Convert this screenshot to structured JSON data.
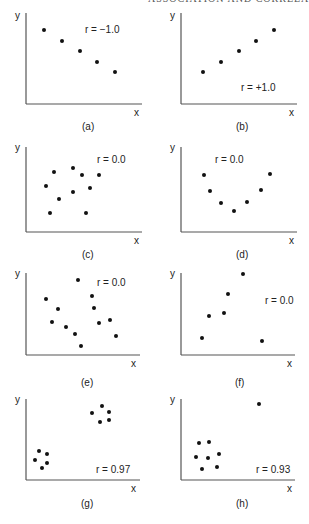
{
  "page": {
    "running_header": "ASSOCIATION AND CORRELATION",
    "caption": ""
  },
  "style": {
    "axis_color": "#555555",
    "point_color": "#111111",
    "text_color": "#222222"
  },
  "chart_data": [
    {
      "type": "scatter",
      "id": "a",
      "panel_label": "(a)",
      "annotation": "r = −1.0",
      "xlabel": "x",
      "ylabel": "y",
      "axis": {
        "x0": 26,
        "y0": 104,
        "x1": 142,
        "ytop": 13
      },
      "label_pos": {
        "annot": [
          85,
          33
        ],
        "panel": [
          82,
          130
        ],
        "xl": [
          134,
          116
        ],
        "yl": [
          15,
          19
        ]
      },
      "points": [
        [
          44,
          30
        ],
        [
          62,
          41
        ],
        [
          80,
          51
        ],
        [
          97,
          62
        ],
        [
          115,
          72
        ]
      ]
    },
    {
      "type": "scatter",
      "id": "b",
      "panel_label": "(b)",
      "annotation": "r = +1.0",
      "xlabel": "x",
      "ylabel": "y",
      "axis": {
        "x0": 181,
        "y0": 104,
        "x1": 297,
        "ytop": 13
      },
      "label_pos": {
        "annot": [
          241,
          91
        ],
        "panel": [
          236,
          130
        ],
        "xl": [
          289,
          116
        ],
        "yl": [
          170,
          19
        ]
      },
      "points": [
        [
          203,
          72
        ],
        [
          221,
          62
        ],
        [
          239,
          51
        ],
        [
          256,
          41
        ],
        [
          274,
          30
        ]
      ]
    },
    {
      "type": "scatter",
      "id": "c",
      "panel_label": "(c)",
      "annotation": "r = 0.0",
      "xlabel": "x",
      "ylabel": "y",
      "axis": {
        "x0": 26,
        "y0": 232,
        "x1": 142,
        "ytop": 147
      },
      "label_pos": {
        "annot": [
          97,
          163
        ],
        "panel": [
          82,
          258
        ],
        "xl": [
          134,
          244
        ],
        "yl": [
          15,
          151
        ]
      },
      "points": [
        [
          54,
          172
        ],
        [
          73,
          168
        ],
        [
          82,
          175
        ],
        [
          99,
          175
        ],
        [
          46,
          186
        ],
        [
          73,
          192
        ],
        [
          90,
          188
        ],
        [
          59,
          199
        ],
        [
          50,
          213
        ],
        [
          86,
          213
        ]
      ]
    },
    {
      "type": "scatter",
      "id": "d",
      "panel_label": "(d)",
      "annotation": "r = 0.0",
      "xlabel": "x",
      "ylabel": "y",
      "axis": {
        "x0": 181,
        "y0": 232,
        "x1": 297,
        "ytop": 147
      },
      "label_pos": {
        "annot": [
          215,
          163
        ],
        "panel": [
          236,
          258
        ],
        "xl": [
          289,
          244
        ],
        "yl": [
          170,
          151
        ]
      },
      "points": [
        [
          204,
          175
        ],
        [
          210,
          191
        ],
        [
          221,
          203
        ],
        [
          234,
          211
        ],
        [
          247,
          202
        ],
        [
          261,
          190
        ],
        [
          270,
          174
        ]
      ]
    },
    {
      "type": "scatter",
      "id": "e",
      "panel_label": "(e)",
      "annotation": "r = 0.0",
      "xlabel": "x",
      "ylabel": "y",
      "axis": {
        "x0": 26,
        "y0": 355,
        "x1": 140,
        "ytop": 273
      },
      "label_pos": {
        "annot": [
          97,
          286
        ],
        "panel": [
          81,
          386
        ],
        "xl": [
          131,
          367
        ],
        "yl": [
          15,
          277
        ]
      },
      "points": [
        [
          78,
          280
        ],
        [
          46,
          299
        ],
        [
          92,
          296
        ],
        [
          58,
          309
        ],
        [
          94,
          308
        ],
        [
          52,
          322
        ],
        [
          66,
          327
        ],
        [
          110,
          320
        ],
        [
          99,
          323
        ],
        [
          75,
          334
        ],
        [
          116,
          336
        ],
        [
          81,
          346
        ]
      ]
    },
    {
      "type": "scatter",
      "id": "f",
      "panel_label": "(f)",
      "annotation": "r = 0.0",
      "xlabel": "x",
      "ylabel": "y",
      "axis": {
        "x0": 181,
        "y0": 355,
        "x1": 295,
        "ytop": 273
      },
      "label_pos": {
        "annot": [
          265,
          304
        ],
        "panel": [
          235,
          386
        ],
        "xl": [
          287,
          367
        ],
        "yl": [
          170,
          277
        ]
      },
      "points": [
        [
          243,
          274
        ],
        [
          228,
          294
        ],
        [
          209,
          316
        ],
        [
          224,
          313
        ],
        [
          202,
          338
        ],
        [
          262,
          341
        ]
      ]
    },
    {
      "type": "scatter",
      "id": "g",
      "panel_label": "(g)",
      "annotation": "r = 0.97",
      "xlabel": "x",
      "ylabel": "y",
      "axis": {
        "x0": 26,
        "y0": 480,
        "x1": 140,
        "ytop": 399
      },
      "label_pos": {
        "annot": [
          96,
          473
        ],
        "panel": [
          81,
          507
        ],
        "xl": [
          131,
          492
        ],
        "yl": [
          15,
          403
        ]
      },
      "points": [
        [
          102,
          406
        ],
        [
          92,
          413
        ],
        [
          109,
          412
        ],
        [
          100,
          422
        ],
        [
          109,
          420
        ],
        [
          39,
          451
        ],
        [
          47,
          454
        ],
        [
          35,
          460
        ],
        [
          47,
          463
        ],
        [
          42,
          468
        ]
      ]
    },
    {
      "type": "scatter",
      "id": "h",
      "panel_label": "(h)",
      "annotation": "r = 0.93",
      "xlabel": "x",
      "ylabel": "y",
      "axis": {
        "x0": 181,
        "y0": 480,
        "x1": 295,
        "ytop": 399
      },
      "label_pos": {
        "annot": [
          256,
          473
        ],
        "panel": [
          236,
          507
        ],
        "xl": [
          287,
          492
        ],
        "yl": [
          170,
          403
        ]
      },
      "points": [
        [
          259,
          404
        ],
        [
          199,
          443
        ],
        [
          209,
          442
        ],
        [
          196,
          457
        ],
        [
          208,
          458
        ],
        [
          219,
          454
        ],
        [
          202,
          469
        ],
        [
          217,
          467
        ]
      ]
    }
  ]
}
